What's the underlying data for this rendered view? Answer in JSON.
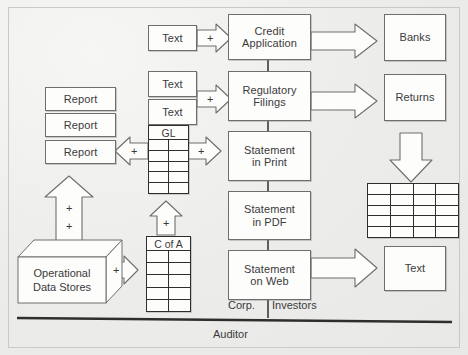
{
  "diagram": {
    "frame": {
      "border_color": "#c9c9c6",
      "background": "#efefed"
    }
  },
  "inputs": {
    "text_credit": "Text",
    "text_reg_1": "Text",
    "text_reg_2": "Text"
  },
  "center_column": [
    {
      "label": "Credit\nApplication",
      "line1": "Credit",
      "line2": "Application"
    },
    {
      "label": "Regulatory\nFilings",
      "line1": "Regulatory",
      "line2": "Filings"
    },
    {
      "label": "Statement\nin Print",
      "line1": "Statement",
      "line2": "in Print"
    },
    {
      "label": "Statement\nin PDF",
      "line1": "Statement",
      "line2": "in PDF"
    },
    {
      "label": "Statement\non Web",
      "line1": "Statement",
      "line2": "on Web"
    }
  ],
  "right_column": {
    "banks": "Banks",
    "returns": "Returns",
    "text": "Text"
  },
  "reports": [
    {
      "label": "Report"
    },
    {
      "label": "Report"
    },
    {
      "label": "Report"
    }
  ],
  "tables": {
    "gl": {
      "header": "GL",
      "rows": 5,
      "cols": 2
    },
    "c_of_a": {
      "header": "C of A",
      "rows": 5,
      "cols": 2
    },
    "grid": {
      "header": "",
      "rows": 5,
      "cols": 4
    }
  },
  "sources": {
    "operational_data_stores_line1": "Operational",
    "operational_data_stores_line2": "Data Stores"
  },
  "plus_signs": {
    "credit": "+",
    "regulatory": "+",
    "gl_right": "+",
    "gl_left": "+",
    "gl_up": "+",
    "c_of_a_up": "+",
    "ods_right": "+",
    "report_up_1": "+",
    "report_up_2": "+"
  },
  "swimlane": {
    "corp": "Corp.",
    "investors": "Investors",
    "auditor": "Auditor"
  },
  "colors": {
    "node_stroke": "#6e6e6e",
    "table_stroke": "#2e2e2e",
    "arrow_stroke": "#6e6e6e",
    "text": "#3a3a3a",
    "divider": "#2e2e2e"
  }
}
